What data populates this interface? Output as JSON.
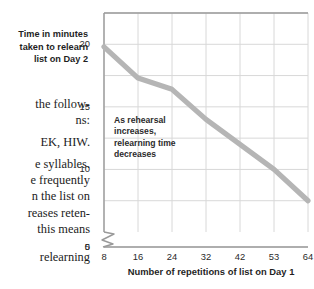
{
  "page": {
    "top_strip_left": "",
    "top_strip_right": ""
  },
  "body_text": {
    "lines": [
      "the follow-",
      "ns:",
      "EK, HIW.",
      "e syllables.",
      "e frequently",
      "n the list on",
      "reases reten-",
      "this means"
    ],
    "trailing_line": "relearning"
  },
  "chart_data": {
    "type": "line",
    "title": "",
    "xlabel": "Number of repetitions of list on Day 1",
    "ylabel": "Time in minutes taken to relearn list on Day 2",
    "ylabel_lines": [
      "Time in minutes",
      "taken to relearn",
      "list on Day 2"
    ],
    "categories": [
      "8",
      "16",
      "24",
      "32",
      "42",
      "53",
      "64"
    ],
    "x": [
      8,
      16,
      24,
      32,
      42,
      53,
      64
    ],
    "values": [
      19.8,
      17.3,
      16.4,
      14.0,
      12.0,
      10.0,
      7.5
    ],
    "series": [
      {
        "name": "Relearning time",
        "values": [
          19.8,
          17.3,
          16.4,
          14.0,
          12.0,
          10.0,
          7.5
        ]
      }
    ],
    "yticks": [
      "0",
      "5",
      "10",
      "15",
      "20"
    ],
    "ytick_values": [
      0,
      5,
      10,
      15,
      20
    ],
    "ylim": [
      0,
      22.5
    ],
    "xlim": [
      8,
      64
    ],
    "grid": true,
    "axis_break": true,
    "axis_break_between": [
      0,
      5
    ],
    "legend": "none",
    "line_color": "#b5b5b5",
    "grid_color": "#d8d8d8",
    "axis_color": "#9a9a9a",
    "annotation": {
      "lines": [
        "As rehearsal",
        "increases,",
        "relearning time",
        "decreases"
      ],
      "text": "As rehearsal increases, relearning time decreases"
    }
  }
}
